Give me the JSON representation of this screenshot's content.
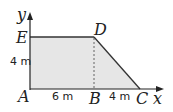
{
  "diagram": {
    "axes": {
      "x_label": "x",
      "y_label": "y"
    },
    "points": {
      "A": "A",
      "B": "B",
      "C": "C",
      "D": "D",
      "E": "E"
    },
    "dimensions": {
      "AE": "4 m",
      "AB": "6 m",
      "BC": "4 m"
    },
    "colors": {
      "fill": "#e6e6e6",
      "stroke": "#333333"
    }
  }
}
